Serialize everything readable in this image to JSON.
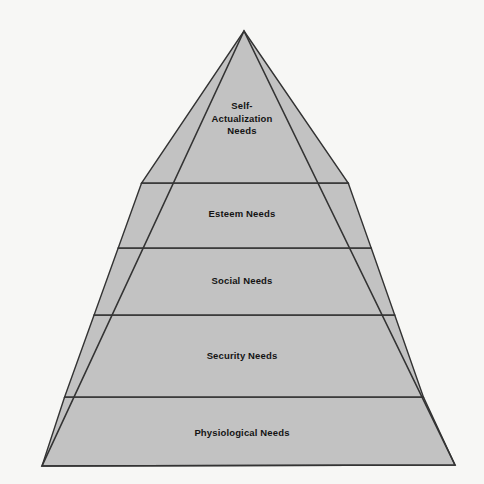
{
  "diagram": {
    "type": "pyramid",
    "background_color": "#f7f7f5",
    "fill_color": "#c2c2c2",
    "outline_color": "#333333",
    "text_color": "#141414",
    "apex": {
      "x": 244,
      "y": 31
    },
    "base_left": {
      "x": 42,
      "y": 466
    },
    "base_right": {
      "x": 455,
      "y": 465
    },
    "divider_y": [
      183,
      248,
      315,
      397
    ],
    "tiers": [
      {
        "id": "self-actualization",
        "order": 1,
        "position": "top",
        "label": "Self-Actualization Needs",
        "lines": [
          "Self-",
          "Actualization",
          "Needs"
        ],
        "top_y": 31,
        "bottom_y": 183
      },
      {
        "id": "esteem",
        "order": 2,
        "position": "fourth",
        "label": "Esteem Needs",
        "lines": [
          "Esteem Needs"
        ],
        "top_y": 183,
        "bottom_y": 248
      },
      {
        "id": "social",
        "order": 3,
        "position": "third",
        "label": "Social Needs",
        "lines": [
          "Social Needs"
        ],
        "top_y": 248,
        "bottom_y": 315
      },
      {
        "id": "security",
        "order": 4,
        "position": "second",
        "label": "Security Needs",
        "lines": [
          "Security Needs"
        ],
        "top_y": 315,
        "bottom_y": 397
      },
      {
        "id": "physiological",
        "order": 5,
        "position": "base",
        "label": "Physiological Needs",
        "lines": [
          "Physiological Needs"
        ],
        "top_y": 397,
        "bottom_y": 466
      }
    ]
  }
}
